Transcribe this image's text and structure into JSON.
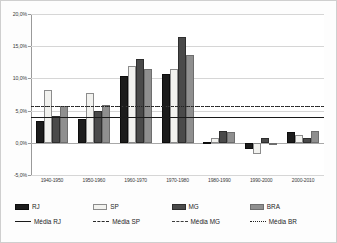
{
  "chart_data": {
    "type": "bar",
    "title": "",
    "xlabel": "",
    "ylabel": "",
    "ylim": [
      -5.0,
      20.0
    ],
    "ytick_values": [
      20.0,
      15.0,
      10.0,
      5.0,
      0.0,
      -5.0
    ],
    "ytick_labels": [
      "20,0%",
      "15,0%",
      "10,0%",
      "5,0%",
      "0,0%",
      "-5,0%"
    ],
    "grid": true,
    "legend_position": "bottom",
    "categories": [
      "1940-1950",
      "1950-1960",
      "1960-1970",
      "1970-1980",
      "1980-1990",
      "1990-2000",
      "2000-2010"
    ],
    "series": [
      {
        "name": "RJ",
        "key": "rj",
        "color": "#1c1c1c",
        "values": [
          3.4,
          3.7,
          10.3,
          10.7,
          0.05,
          -0.9,
          1.7
        ]
      },
      {
        "name": "SP",
        "key": "sp",
        "color": "#f2f2ef",
        "values": [
          8.2,
          7.8,
          11.9,
          11.5,
          0.8,
          -1.7,
          1.2
        ]
      },
      {
        "name": "MG",
        "key": "mg",
        "color": "#4a4a4a",
        "values": [
          4.2,
          4.9,
          13.0,
          16.5,
          1.8,
          0.8,
          0.75
        ]
      },
      {
        "name": "BRA",
        "key": "bra",
        "color": "#8f8f8f",
        "values": [
          5.7,
          5.9,
          11.5,
          13.6,
          1.6,
          -0.15,
          1.85
        ]
      }
    ],
    "reference_lines": [
      {
        "name": "Média RJ",
        "key": "rj",
        "style": "solid",
        "value": 4.0,
        "color": "#1a1a1a"
      },
      {
        "name": "Média SP",
        "key": "sp",
        "style": "dashed",
        "value": 5.7,
        "color": "#2a2a2a"
      },
      {
        "name": "Média MG",
        "key": "mg",
        "style": "dashdot",
        "value": 5.75,
        "color": "#3d3d3d"
      },
      {
        "name": "Média BR",
        "key": "br",
        "style": "dotted",
        "value": 5.65,
        "color": "#222222"
      }
    ]
  },
  "legend": {
    "bars": [
      {
        "label": "RJ"
      },
      {
        "label": "SP"
      },
      {
        "label": "MG"
      },
      {
        "label": "BRA"
      }
    ],
    "lines": [
      {
        "label": "Média RJ"
      },
      {
        "label": "Média SP"
      },
      {
        "label": "Média MG"
      },
      {
        "label": "Média BR"
      }
    ]
  }
}
